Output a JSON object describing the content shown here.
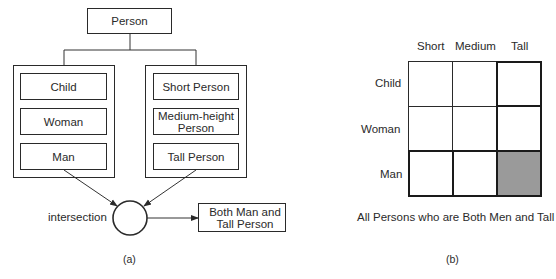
{
  "diagram_a": {
    "root": "Person",
    "age_gender_group": [
      "Child",
      "Woman",
      "Man"
    ],
    "height_group": [
      "Short Person",
      "Medium-height Person",
      "Tall Person"
    ],
    "height_group_lines": [
      [
        "Short Person"
      ],
      [
        "Medium-height",
        "Person"
      ],
      [
        "Tall Person"
      ]
    ],
    "operator_label": "intersection",
    "result_lines": [
      "Both Man and",
      "Tall Person"
    ],
    "caption": "(a)"
  },
  "diagram_b": {
    "columns": [
      "Short",
      "Medium",
      "Tall"
    ],
    "rows": [
      "Child",
      "Woman",
      "Man"
    ],
    "highlighted_cell": {
      "row": "Man",
      "column": "Tall"
    },
    "highlight_color": "#9a9a9a",
    "description": "All Persons who are Both Men and Tall",
    "caption": "(b)"
  }
}
